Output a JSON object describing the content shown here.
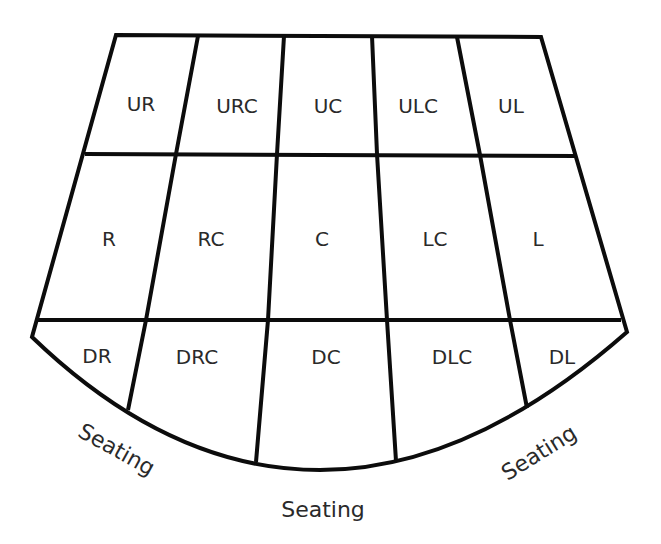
{
  "diagram": {
    "rows": [
      {
        "name": "upstage",
        "areas": [
          "UR",
          "URC",
          "UC",
          "ULC",
          "UL"
        ]
      },
      {
        "name": "center",
        "areas": [
          "R",
          "RC",
          "C",
          "LC",
          "L"
        ]
      },
      {
        "name": "downstage",
        "areas": [
          "DR",
          "DRC",
          "DC",
          "DLC",
          "DL"
        ]
      }
    ],
    "seating": {
      "left": "Seating",
      "center": "Seating",
      "right": "Seating"
    },
    "colors": {
      "line": "#0c0c0c",
      "text": "#2a2a2a",
      "background": "#ffffff"
    }
  }
}
